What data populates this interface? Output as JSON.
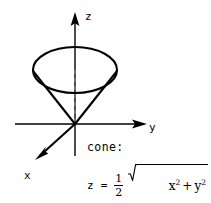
{
  "figure": {
    "title": "cone",
    "type": "3d-cone-with-axes",
    "background_color": "#ffffff",
    "stroke_color": "#000000"
  },
  "axes": {
    "z": {
      "label": "z",
      "direction": "up",
      "arrow": true
    },
    "y": {
      "label": "y",
      "direction": "right",
      "arrow": true
    },
    "x": {
      "label": "x",
      "direction": "down-left",
      "arrow": true
    }
  },
  "caption": {
    "name": "cone:"
  },
  "equation": {
    "lhs": "z",
    "equals": "=",
    "coefficient_numerator": "1",
    "coefficient_denominator": "2",
    "radicand_first_base": "x",
    "radicand_first_exponent": "2",
    "radicand_operator": "+",
    "radicand_second_base": "y",
    "radicand_second_exponent": "2",
    "plain_text": "z = 1/2 sqrt(x^2 + y^2)"
  },
  "geometry": {
    "origin": {
      "x": 75,
      "y": 124
    },
    "ellipse": {
      "cx": 75,
      "cy": 70,
      "rx": 42,
      "ry": 23
    },
    "dashed_axis_note": "dashed vertical segment inside cone from ellipse center to apex"
  }
}
